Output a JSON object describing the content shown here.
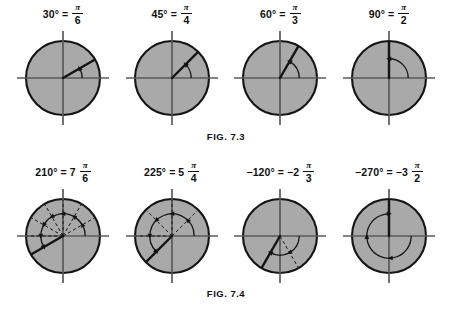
{
  "page": {
    "background_color": "#ffffff",
    "circle_fill_color": "#a9a9a9",
    "stroke_color": "#141414",
    "axis_color": "#5a5a5a"
  },
  "figures": [
    {
      "caption": "FIG. 7.3",
      "panels": [
        {
          "degrees": "30°",
          "equals": "=",
          "coefficient": "",
          "numerator": "π",
          "denominator": "6",
          "angle_value": 30,
          "direction": "counterclockwise",
          "guides": 0
        },
        {
          "degrees": "45°",
          "equals": "=",
          "coefficient": "",
          "numerator": "π",
          "denominator": "4",
          "angle_value": 45,
          "direction": "counterclockwise",
          "guides": 0
        },
        {
          "degrees": "60°",
          "equals": "=",
          "coefficient": "",
          "numerator": "π",
          "denominator": "3",
          "angle_value": 60,
          "direction": "counterclockwise",
          "guides": 0
        },
        {
          "degrees": "90°",
          "equals": "=",
          "coefficient": "",
          "numerator": "π",
          "denominator": "2",
          "angle_value": 90,
          "direction": "counterclockwise",
          "guides": 0
        }
      ]
    },
    {
      "caption": "FIG. 7.4",
      "panels": [
        {
          "degrees": "210°",
          "equals": "=",
          "coefficient": "7",
          "numerator": "π",
          "denominator": "6",
          "angle_value": 210,
          "direction": "counterclockwise",
          "guides": 30
        },
        {
          "degrees": "225°",
          "equals": "=",
          "coefficient": "5",
          "numerator": "π",
          "denominator": "4",
          "angle_value": 225,
          "direction": "counterclockwise",
          "guides": 45
        },
        {
          "degrees": "−120°",
          "equals": "=",
          "coefficient": "−2",
          "numerator": "π",
          "denominator": "3",
          "angle_value": -120,
          "direction": "clockwise",
          "guides": 60
        },
        {
          "degrees": "−270°",
          "equals": "=",
          "coefficient": "−3",
          "numerator": "π",
          "denominator": "2",
          "angle_value": -270,
          "direction": "clockwise",
          "guides": 0
        }
      ]
    }
  ]
}
